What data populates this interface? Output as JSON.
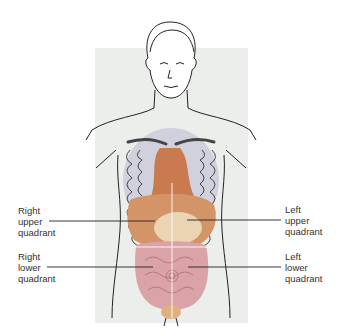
{
  "diagram": {
    "labels": {
      "right_upper": [
        "Right",
        "upper",
        "quadrant"
      ],
      "left_upper": [
        "Left",
        "upper",
        "quadrant"
      ],
      "right_lower": [
        "Right",
        "lower",
        "quadrant"
      ],
      "left_lower": [
        "Left",
        "lower",
        "quadrant"
      ]
    },
    "colors": {
      "panel": "#eceeeb",
      "outline": "#222222",
      "ribs": "#c9cbd8",
      "organ_upper": "#c97a4e",
      "liver": "#d8a070",
      "intestines": "#d9a3a8",
      "quadrant_lines": "#ffffff"
    }
  }
}
